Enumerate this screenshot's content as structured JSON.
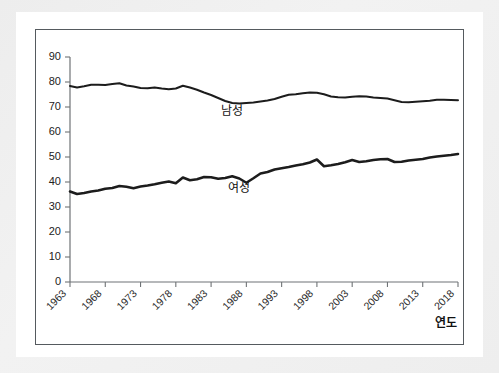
{
  "chart_data": {
    "type": "line",
    "title": "",
    "subtitle": "",
    "xlabel": "연도",
    "ylabel": "",
    "xlim": [
      1963,
      2018
    ],
    "ylim": [
      0,
      90
    ],
    "grid": false,
    "legend_position": "inline-annotation",
    "y_ticks": [
      0,
      10,
      20,
      30,
      40,
      50,
      60,
      70,
      80,
      90
    ],
    "x_ticks": [
      1963,
      1968,
      1973,
      1978,
      1983,
      1988,
      1993,
      1998,
      2003,
      2008,
      2013,
      2018
    ],
    "x_tick_labels": [
      "1963",
      "1968",
      "1973",
      "1978",
      "1983",
      "1988",
      "1993",
      "1998",
      "2003",
      "2008",
      "2013",
      "2018"
    ],
    "y_tick_labels": [
      "0",
      "10",
      "20",
      "30",
      "40",
      "50",
      "60",
      "70",
      "80",
      "90"
    ],
    "x": [
      1963,
      1964,
      1965,
      1966,
      1967,
      1968,
      1969,
      1970,
      1971,
      1972,
      1973,
      1974,
      1975,
      1976,
      1977,
      1978,
      1979,
      1980,
      1981,
      1982,
      1983,
      1984,
      1985,
      1986,
      1987,
      1988,
      1989,
      1990,
      1991,
      1992,
      1993,
      1994,
      1995,
      1996,
      1997,
      1998,
      1999,
      2000,
      2001,
      2002,
      2003,
      2004,
      2005,
      2006,
      2007,
      2008,
      2009,
      2010,
      2011,
      2012,
      2013,
      2014,
      2015,
      2016,
      2017,
      2018
    ],
    "series": [
      {
        "name": "남성",
        "label": "남성",
        "color": "#1c1c1c",
        "values": [
          78.4,
          77.8,
          78.3,
          78.9,
          78.9,
          78.8,
          79.2,
          79.5,
          78.6,
          78.2,
          77.6,
          77.5,
          77.8,
          77.4,
          77.1,
          77.4,
          78.5,
          77.8,
          76.9,
          75.8,
          74.8,
          73.6,
          72.4,
          71.6,
          71.4,
          71.6,
          71.8,
          72.2,
          72.6,
          73.2,
          74.1,
          74.9,
          75.1,
          75.5,
          75.8,
          75.7,
          75.1,
          74.2,
          73.9,
          73.8,
          74.1,
          74.3,
          74.2,
          73.8,
          73.6,
          73.4,
          72.7,
          72.0,
          71.9,
          72.1,
          72.3,
          72.5,
          72.9,
          72.9,
          72.8,
          72.7
        ],
        "annotation": {
          "text": "남성",
          "x": 1986,
          "y": 67
        }
      },
      {
        "name": "여성",
        "label": "여성",
        "color": "#1c1c1c",
        "values": [
          36.2,
          35.2,
          35.6,
          36.2,
          36.6,
          37.3,
          37.6,
          38.4,
          38.1,
          37.5,
          38.2,
          38.6,
          39.1,
          39.7,
          40.2,
          39.5,
          41.8,
          40.7,
          41.1,
          42.0,
          41.9,
          41.3,
          41.6,
          42.3,
          41.4,
          39.7,
          41.5,
          43.4,
          44.0,
          45.0,
          45.5,
          46.0,
          46.6,
          47.1,
          47.8,
          49.0,
          46.3,
          46.7,
          47.2,
          47.9,
          48.8,
          48.0,
          48.3,
          48.8,
          49.1,
          49.2,
          48.0,
          48.1,
          48.6,
          48.9,
          49.2,
          49.8,
          50.2,
          50.5,
          50.8,
          51.2
        ],
        "annotation": {
          "text": "여성",
          "x": 1987,
          "y": 36
        }
      }
    ]
  },
  "axis_titles": {
    "x_axis_label": "연도"
  }
}
